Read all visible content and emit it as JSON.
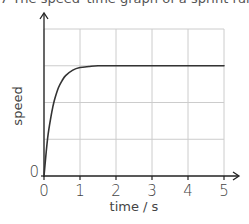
{
  "header": {
    "text": "7  The speed–time graph of a sprint runner is"
  },
  "chart_data": {
    "type": "line",
    "title": "",
    "xlabel": "time / s",
    "ylabel": "speed",
    "x_ticks": [
      "0",
      "1",
      "2",
      "3",
      "4",
      "5"
    ],
    "y_ticks": [
      "0"
    ],
    "xlim": [
      0,
      5
    ],
    "ylim": [
      0,
      4
    ],
    "grid": true,
    "grid_rows": 4,
    "grid_cols": 5,
    "legend": null,
    "series": [
      {
        "name": "speed",
        "description": "Rises steeply from 0 at t=0, levels off to a constant plateau (~3 grid units) by about t=1.5 s, then stays constant to t=5 s",
        "x": [
          0,
          0.1,
          0.2,
          0.25,
          0.3,
          0.4,
          0.5,
          0.6,
          0.8,
          1.0,
          1.25,
          1.5,
          2,
          3,
          4,
          5
        ],
        "values": [
          0,
          1.02,
          1.65,
          1.9,
          2.1,
          2.4,
          2.59,
          2.73,
          2.88,
          2.95,
          2.98,
          3.0,
          3.0,
          3.0,
          3.0,
          3.0
        ]
      }
    ],
    "colors": {
      "axis": "#222222",
      "grid": "#cccccc",
      "curve": "#333333"
    }
  }
}
